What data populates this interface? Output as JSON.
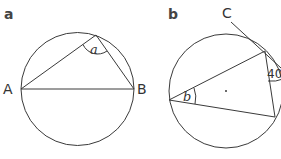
{
  "figure": {
    "panels": [
      {
        "id": "a",
        "label": "a",
        "points": {
          "A": "A",
          "B": "B"
        },
        "angle_label": "a",
        "description": "Angle in a semicircle subtended by diameter AB"
      },
      {
        "id": "b",
        "label": "b",
        "points": {
          "C": "C"
        },
        "angle_label": "b",
        "given_angle": "40",
        "description": "Tangent at point on circle with 40 degree angle; find angle b"
      }
    ],
    "colors": {
      "stroke": "#3a3a3a",
      "text": "#333333",
      "background": "#ffffff"
    }
  }
}
